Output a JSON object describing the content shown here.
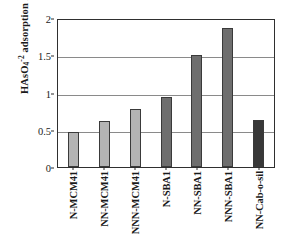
{
  "chart_data": {
    "type": "bar",
    "title": "",
    "xlabel": "",
    "ylabel": "HAsO4-2 adsorption / mmol g-1",
    "ylabel_parts": {
      "pre": "HAsO",
      "sub": "4",
      "sup": "-2",
      "mid": " adsorption / mmol g",
      "sup2": "-1"
    },
    "ylim": [
      0,
      2
    ],
    "yticks": [
      0,
      0.5,
      1,
      1.5,
      2
    ],
    "ytick_labels": [
      "0",
      "0.5",
      "1",
      "1.5",
      "2"
    ],
    "grid": "horizontal",
    "legend": "none",
    "categories": [
      "N-MCM41",
      "NN-MCM41",
      "NNN-MCM41",
      "N-SBA1",
      "NN-SBA1",
      "NNN-SBA1",
      "NN-Cab-o-sil"
    ],
    "values": [
      0.47,
      0.62,
      0.78,
      0.94,
      1.51,
      1.86,
      0.63
    ],
    "bar_colors": [
      "#b4b4b4",
      "#b4b4b4",
      "#b4b4b4",
      "#6e6e6e",
      "#6e6e6e",
      "#6e6e6e",
      "#383838"
    ]
  },
  "colors": {
    "axis": "#2f2f2f",
    "grid": "#8a8a8a",
    "text": "#1a1a1a",
    "background": "#ffffff",
    "series_light": "#b4b4b4",
    "series_medium": "#6e6e6e",
    "series_dark": "#383838"
  }
}
